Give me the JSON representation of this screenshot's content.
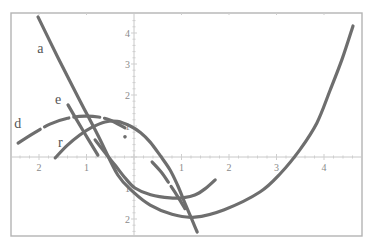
{
  "chart_data": {
    "type": "line",
    "title": "",
    "xlabel": "",
    "ylabel": "",
    "xlim": [
      -2.57,
      4.8
    ],
    "ylim": [
      -2.55,
      4.65
    ],
    "grid": false,
    "legend": "none (inline curve labels)",
    "x_ticks": [
      {
        "value": -2,
        "label": "2"
      },
      {
        "value": -1,
        "label": "1"
      },
      {
        "value": 1,
        "label": "1"
      },
      {
        "value": 2,
        "label": "2"
      },
      {
        "value": 3,
        "label": "3"
      },
      {
        "value": 4,
        "label": "4"
      }
    ],
    "y_ticks": [
      {
        "value": 4,
        "label": "4"
      },
      {
        "value": 3,
        "label": "3"
      },
      {
        "value": 2,
        "label": "2"
      },
      {
        "value": 1,
        "label": "1"
      },
      {
        "value": -1,
        "label": "1"
      },
      {
        "value": -2,
        "label": "2"
      }
    ],
    "series": [
      {
        "name": "a",
        "style": "solid",
        "label_pos": [
          -1.97,
          3.35
        ],
        "points": [
          [
            -2.02,
            4.52
          ],
          [
            -1.6,
            3.2
          ],
          [
            -1.18,
            1.94
          ],
          [
            -0.76,
            0.7
          ],
          [
            -0.34,
            -0.58
          ],
          [
            0.0,
            -1.15
          ],
          [
            0.34,
            -1.55
          ],
          [
            0.8,
            -1.85
          ],
          [
            1.28,
            -1.94
          ],
          [
            1.9,
            -1.7
          ],
          [
            2.65,
            -1.13
          ],
          [
            3.1,
            -0.5
          ],
          [
            3.49,
            0.23
          ],
          [
            3.85,
            1.1
          ],
          [
            4.13,
            2.16
          ],
          [
            4.38,
            3.15
          ],
          [
            4.61,
            4.23
          ]
        ]
      },
      {
        "name": "d",
        "style": "dashed",
        "label_pos": [
          -2.45,
          0.95
        ],
        "points": [
          [
            -2.44,
            0.45
          ],
          [
            -2.1,
            0.78
          ],
          [
            -1.77,
            1.06
          ],
          [
            -1.4,
            1.25
          ],
          [
            -1.03,
            1.32
          ],
          [
            -0.75,
            1.29
          ],
          [
            -0.51,
            1.19
          ],
          [
            -0.19,
            0.94
          ]
        ],
        "tail_points": [
          [
            0.38,
            -0.16
          ],
          [
            0.58,
            -0.5
          ],
          [
            0.76,
            -0.9
          ],
          [
            0.93,
            -1.3
          ],
          [
            1.09,
            -1.71
          ]
        ],
        "dot": [
          -0.19,
          0.65
        ]
      },
      {
        "name": "r",
        "style": "solid",
        "label_pos": [
          -1.55,
          0.33
        ],
        "points": [
          [
            -1.66,
            -0.03
          ],
          [
            -1.4,
            0.38
          ],
          [
            -1.14,
            0.71
          ],
          [
            -0.88,
            0.96
          ],
          [
            -0.61,
            1.13
          ],
          [
            -0.35,
            1.15
          ],
          [
            -0.08,
            1.0
          ],
          [
            0.14,
            0.78
          ],
          [
            0.34,
            0.48
          ],
          [
            0.55,
            0.05
          ],
          [
            0.76,
            -0.42
          ],
          [
            0.92,
            -0.92
          ],
          [
            1.07,
            -1.48
          ],
          [
            1.2,
            -1.95
          ],
          [
            1.33,
            -2.42
          ]
        ]
      },
      {
        "name": "e",
        "style": "solid",
        "label_pos": [
          -1.6,
          1.7
        ],
        "points": [
          [
            -1.39,
            1.68
          ],
          [
            -1.08,
            0.87
          ],
          [
            -0.76,
            0.06
          ]
        ]
      },
      {
        "name": "",
        "style": "solid",
        "label_pos": null,
        "points": [
          [
            -0.82,
            0.55
          ],
          [
            -0.6,
            0.12
          ],
          [
            -0.4,
            -0.26
          ],
          [
            -0.2,
            -0.65
          ],
          [
            0.02,
            -1.0
          ],
          [
            0.35,
            -1.22
          ],
          [
            0.76,
            -1.32
          ],
          [
            1.05,
            -1.31
          ],
          [
            1.28,
            -1.23
          ],
          [
            1.5,
            -1.02
          ],
          [
            1.71,
            -0.74
          ]
        ]
      }
    ]
  },
  "plot": {
    "frame": {
      "left": 11,
      "top": 13,
      "right": 362,
      "bottom": 236
    },
    "origin_px": [
      134,
      157
    ],
    "unit_px": [
      47.5,
      31
    ],
    "curve_color": "#6e6e6e",
    "axis_color": "#c8c8c8"
  }
}
